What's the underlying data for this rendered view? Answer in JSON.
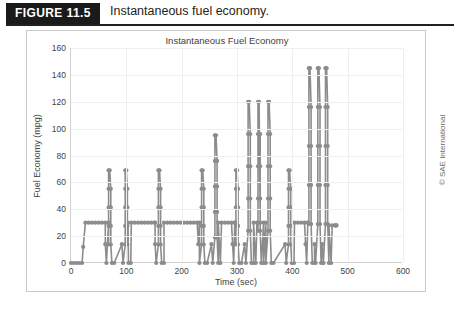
{
  "figure": {
    "tag": "FIGURE 11.5",
    "caption": "Instantaneous fuel economy.",
    "credit": "© SAE International"
  },
  "chart_data": {
    "type": "line",
    "title": "Instantaneous Fuel Economy",
    "xlabel": "Time (sec)",
    "ylabel": "Fuel Economy (mpg)",
    "xlim": [
      0,
      600
    ],
    "ylim": [
      0,
      160
    ],
    "xticks": [
      0,
      100,
      200,
      300,
      400,
      500,
      600
    ],
    "yticks": [
      0,
      20,
      40,
      60,
      80,
      100,
      120,
      140,
      160
    ],
    "grid": true,
    "legend": "none",
    "marker": "circle",
    "line_color": "#8c8c8c",
    "marker_color": "#8c8c8c",
    "series": [
      {
        "name": "Instantaneous Fuel Economy",
        "x": [
          0,
          5,
          10,
          15,
          20,
          25,
          30,
          35,
          40,
          45,
          50,
          55,
          60,
          65,
          70,
          75,
          80,
          85,
          90,
          95,
          100,
          105,
          110,
          115,
          120,
          125,
          130,
          135,
          140,
          145,
          150,
          155,
          160,
          165,
          170,
          175,
          180,
          185,
          190,
          195,
          200,
          205,
          210,
          215,
          220,
          225,
          230,
          235,
          240,
          245,
          250,
          255,
          260,
          265,
          270,
          275,
          280,
          285,
          290,
          295,
          300,
          305,
          310,
          315,
          320,
          325,
          330,
          335,
          340,
          345,
          350,
          355,
          360,
          365,
          370,
          375,
          380,
          385,
          390,
          395,
          400,
          405,
          410,
          415,
          420,
          425,
          430,
          435,
          440,
          445,
          450,
          455,
          460,
          465,
          470,
          475,
          480
        ],
        "y": [
          0,
          0,
          0,
          0,
          0,
          12,
          30,
          30,
          30,
          30,
          30,
          30,
          30,
          30,
          8,
          0,
          14,
          28,
          41,
          55,
          69,
          55,
          41,
          28,
          14,
          0,
          0,
          30,
          30,
          30,
          30,
          0,
          14,
          28,
          41,
          55,
          69,
          55,
          41,
          28,
          14,
          0,
          22,
          30,
          30,
          30,
          30,
          30,
          30,
          30,
          30,
          30,
          30,
          30,
          30,
          30,
          30,
          30,
          30,
          30,
          30,
          30,
          30,
          30,
          14,
          0,
          14,
          28,
          41,
          55,
          69,
          55,
          41,
          28,
          14,
          0,
          30,
          30,
          30,
          30,
          30,
          14,
          0,
          0,
          14,
          34,
          69,
          52,
          34,
          17,
          0,
          0,
          0,
          0,
          14,
          30,
          30
        ],
        "note": "Low-resolution trace: baseline ~30 mpg cruise plateaus punctuated by deceleration fuel-cut spikes reaching 69, 95, 120 and 145 mpg, with acceleration dips to 0 mpg."
      }
    ],
    "spikes": [
      {
        "x": 70,
        "peak": 69
      },
      {
        "x": 100,
        "peak": 69
      },
      {
        "x": 160,
        "peak": 69
      },
      {
        "x": 238,
        "peak": 69
      },
      {
        "x": 262,
        "peak": 95
      },
      {
        "x": 300,
        "peak": 69
      },
      {
        "x": 322,
        "peak": 120
      },
      {
        "x": 340,
        "peak": 120
      },
      {
        "x": 358,
        "peak": 120
      },
      {
        "x": 395,
        "peak": 69
      },
      {
        "x": 432,
        "peak": 145
      },
      {
        "x": 448,
        "peak": 145
      },
      {
        "x": 462,
        "peak": 145
      }
    ],
    "plateaus": [
      {
        "x_start": 26,
        "x_end": 68,
        "value": 30
      },
      {
        "x_start": 103,
        "x_end": 152,
        "value": 30
      },
      {
        "x_start": 168,
        "x_end": 232,
        "value": 30
      },
      {
        "x_start": 266,
        "x_end": 296,
        "value": 30
      },
      {
        "x_start": 330,
        "x_end": 352,
        "value": 30
      },
      {
        "x_start": 404,
        "x_end": 428,
        "value": 30
      },
      {
        "x_start": 466,
        "x_end": 478,
        "value": 28
      }
    ]
  }
}
